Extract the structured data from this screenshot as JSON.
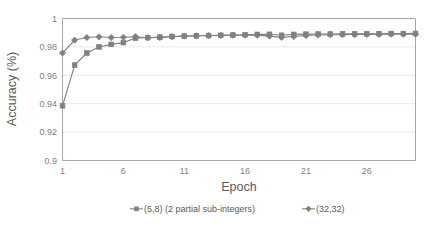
{
  "chart_data": {
    "type": "line",
    "title": "",
    "xlabel": "Epoch",
    "ylabel": "Accuracy (%)",
    "xlim": [
      1,
      30
    ],
    "ylim": [
      0.9,
      1.0
    ],
    "xticks": [
      1,
      6,
      11,
      16,
      21,
      26
    ],
    "xtick_labels": [
      "1",
      "6",
      "11",
      "16",
      "21",
      "26"
    ],
    "yticks": [
      0.9,
      0.92,
      0.94,
      0.96,
      0.98,
      1
    ],
    "ytick_labels": [
      "0.9",
      "0.92",
      "0.94",
      "0.96",
      "0.98",
      "1"
    ],
    "grid": "horizontal",
    "legend_position": "bottom-center",
    "series_color": "#808080",
    "x": [
      1,
      2,
      3,
      4,
      5,
      6,
      7,
      8,
      9,
      10,
      11,
      12,
      13,
      14,
      15,
      16,
      17,
      18,
      19,
      20,
      21,
      22,
      23,
      24,
      25,
      26,
      27,
      28,
      29,
      30
    ],
    "series": [
      {
        "name": "(5,8) (2 partial sub-integers)",
        "marker": "square",
        "color": "#808080",
        "values": [
          0.9385,
          0.9672,
          0.9757,
          0.98,
          0.9818,
          0.983,
          0.9862,
          0.9866,
          0.9869,
          0.9873,
          0.9876,
          0.9878,
          0.988,
          0.9882,
          0.9884,
          0.9886,
          0.9888,
          0.9889,
          0.9882,
          0.9888,
          0.989,
          0.9891,
          0.9891,
          0.9892,
          0.9892,
          0.9893,
          0.9893,
          0.9894,
          0.9894,
          0.9895
        ]
      },
      {
        "name": "(32,32)",
        "marker": "diamond",
        "color": "#808080",
        "values": [
          0.9757,
          0.9848,
          0.9866,
          0.9871,
          0.9866,
          0.9868,
          0.9872,
          0.9864,
          0.9866,
          0.9872,
          0.9876,
          0.9878,
          0.9879,
          0.9881,
          0.9882,
          0.9882,
          0.9883,
          0.9876,
          0.9867,
          0.9873,
          0.988,
          0.9884,
          0.9886,
          0.9886,
          0.9887,
          0.9888,
          0.9888,
          0.9889,
          0.9889,
          0.9889
        ]
      }
    ]
  },
  "legend": {
    "items": [
      {
        "label": "(5,8) (2 partial sub-integers)",
        "marker": "square"
      },
      {
        "label": "(32,32)",
        "marker": "diamond"
      }
    ]
  }
}
